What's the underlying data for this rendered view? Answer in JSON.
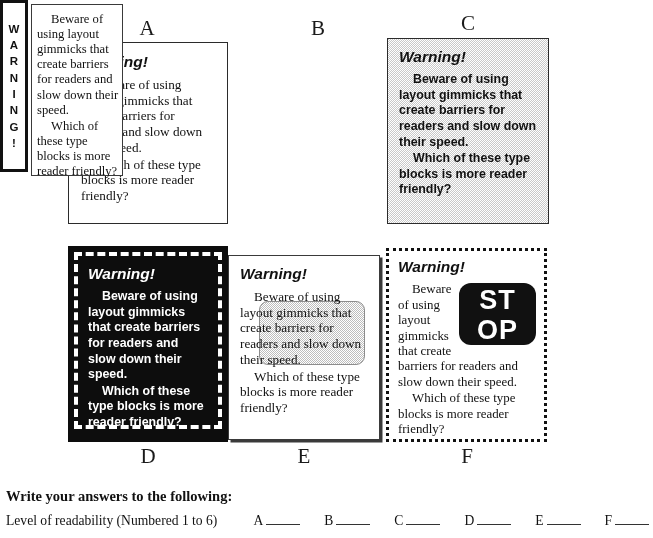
{
  "warning_text": {
    "heading": "Warning!",
    "para1": "Beware of using layout gimmicks that create barriers for readers and slow down their speed.",
    "para2": "Which of these type blocks is more reader friendly?"
  },
  "panels": [
    {
      "letter": "A",
      "heading": "Warning!",
      "para1": "Beware of using layout gimmicks that create barriers for readers and slow down their speed.",
      "para2": "Which of these type blocks is more reader friendly?"
    },
    {
      "letter": "B",
      "vertical_word": "WARNING!",
      "vertical_letters": [
        "W",
        "A",
        "R",
        "N",
        "I",
        "N",
        "G",
        "!"
      ],
      "para1": "Beware of using layout gimmicks that create barriers for readers and slow down their speed.",
      "para2": "Which of these type blocks is more reader friendly?"
    },
    {
      "letter": "C",
      "heading": "Warning!",
      "para1": "Beware of using layout gimmicks that create barriers for readers and slow down their speed.",
      "para2": "Which of these type blocks is more reader friendly?"
    },
    {
      "letter": "D",
      "heading": "Warning!",
      "para1": "Beware of using layout gimmicks that create barriers for readers and slow down their speed.",
      "para2": "Which of these type blocks is more reader friendly?"
    },
    {
      "letter": "E",
      "heading": "Warning!",
      "para1": "Beware of using layout gimmicks that create barriers for readers and slow down their speed.",
      "para2": "Which of these type blocks is more reader friendly?"
    },
    {
      "letter": "F",
      "heading": "Warning!",
      "stop_line1": "ST",
      "stop_line2": "OP",
      "para1": "Beware of using layout gimmicks that create barriers for readers and slow down their speed.",
      "para2": "Which of these type blocks is more reader friendly?"
    }
  ],
  "form": {
    "title": "Write your answers to the following:",
    "question": "Level of readability (Numbered 1 to 6)",
    "answers": [
      {
        "label": "A",
        "value": ""
      },
      {
        "label": "B",
        "value": ""
      },
      {
        "label": "C",
        "value": ""
      },
      {
        "label": "D",
        "value": ""
      },
      {
        "label": "E",
        "value": ""
      },
      {
        "label": "F",
        "value": ""
      }
    ]
  },
  "colors": {
    "ink": "#111111",
    "panel_border": "#2b2b2b",
    "gray_fill": "#c9c9c9",
    "black_fill": "#0d0d0d",
    "paper": "#ffffff"
  }
}
